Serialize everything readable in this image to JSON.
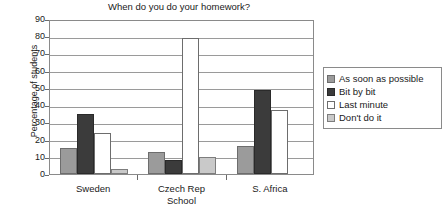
{
  "chart_data": {
    "type": "bar",
    "title": "When do you do your homework?",
    "xlabel": "School",
    "ylabel": "Percentage of students",
    "categories": [
      "Sweden",
      "Czech Rep",
      "S. Africa"
    ],
    "series": [
      {
        "name": "As soon as possible",
        "color": "#9b9b9b",
        "values": [
          15,
          13,
          16
        ]
      },
      {
        "name": "Bit by bit",
        "color": "#3b3b3b",
        "values": [
          35,
          8,
          49
        ]
      },
      {
        "name": "Last minute",
        "color": "#ffffff",
        "values": [
          24,
          79,
          37
        ]
      },
      {
        "name": "Don't do it",
        "color": "#c9c9c9",
        "values": [
          3,
          10,
          0
        ]
      }
    ],
    "ylim": [
      0,
      90
    ],
    "yticks": [
      0,
      10,
      20,
      30,
      40,
      50,
      60,
      70,
      80,
      90
    ],
    "grid": true,
    "legend_position": "right"
  }
}
